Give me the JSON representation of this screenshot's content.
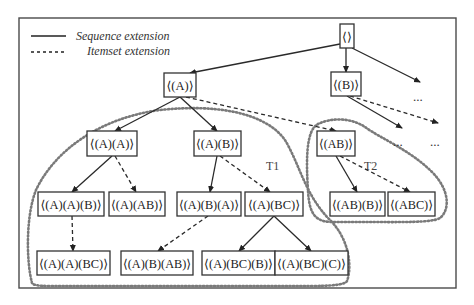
{
  "diagram": {
    "legend": {
      "sequence_label": "Sequence extension",
      "itemset_label": "Itemset extension"
    },
    "frame": {
      "x": 19,
      "y": 18,
      "w": 437,
      "h": 270
    },
    "nodes": [
      {
        "id": "root",
        "label": "⟨⟩",
        "x": 340,
        "y": 24,
        "w": 14,
        "h": 24
      },
      {
        "id": "A",
        "label": "⟨(A)⟩",
        "x": 164,
        "y": 73,
        "w": 32,
        "h": 24
      },
      {
        "id": "B",
        "label": "⟨(B)⟩",
        "x": 331,
        "y": 72,
        "w": 30,
        "h": 24
      },
      {
        "id": "AA",
        "label": "⟨(A)(A)⟩",
        "x": 87,
        "y": 131,
        "w": 50,
        "h": 25
      },
      {
        "id": "AB_seq",
        "label": "⟨(A)(B)⟩",
        "x": 194,
        "y": 131,
        "w": 47,
        "h": 25
      },
      {
        "id": "AB_item",
        "label": "⟨(AB)⟩",
        "x": 317,
        "y": 131,
        "w": 38,
        "h": 25
      },
      {
        "id": "AAB",
        "label": "⟨(A)(A)(B)⟩",
        "x": 38,
        "y": 192,
        "w": 66,
        "h": 24
      },
      {
        "id": "A_AB",
        "label": "⟨(A)(AB)⟩",
        "x": 109,
        "y": 192,
        "w": 56,
        "h": 24
      },
      {
        "id": "ABA",
        "label": "⟨(A)(B)(A)⟩",
        "x": 177,
        "y": 192,
        "w": 64,
        "h": 24
      },
      {
        "id": "A_BC",
        "label": "⟨(A)(BC)⟩",
        "x": 245,
        "y": 192,
        "w": 58,
        "h": 24
      },
      {
        "id": "AB_B",
        "label": "⟨(AB)(B)⟩",
        "x": 330,
        "y": 192,
        "w": 55,
        "h": 24
      },
      {
        "id": "ABC",
        "label": "⟨(ABC)⟩",
        "x": 388,
        "y": 192,
        "w": 47,
        "h": 24
      },
      {
        "id": "AA_BC",
        "label": "⟨(A)(A)(BC)⟩",
        "x": 37,
        "y": 251,
        "w": 73,
        "h": 24
      },
      {
        "id": "AB_AB",
        "label": "⟨(A)(B)(AB)⟩",
        "x": 121,
        "y": 251,
        "w": 72,
        "h": 24
      },
      {
        "id": "ABC_B",
        "label": "⟨(A)(BC)(B)⟩",
        "x": 202,
        "y": 251,
        "w": 73,
        "h": 24
      },
      {
        "id": "ABC_C",
        "label": "⟨(A)(BC)(C)⟩",
        "x": 275,
        "y": 251,
        "w": 73,
        "h": 24
      }
    ],
    "edges": [
      {
        "from": "root",
        "to": "A",
        "type": "sequence",
        "x1": 340,
        "y1": 44,
        "x2": 190,
        "y2": 73
      },
      {
        "from": "root",
        "to": "B",
        "type": "sequence",
        "x1": 346,
        "y1": 48,
        "x2": 346,
        "y2": 72
      },
      {
        "from": "root",
        "to": "more",
        "type": "sequence",
        "x1": 352,
        "y1": 48,
        "x2": 420,
        "y2": 82
      },
      {
        "from": "A",
        "to": "AA",
        "type": "sequence",
        "x1": 180,
        "y1": 97,
        "x2": 115,
        "y2": 131
      },
      {
        "from": "A",
        "to": "AB_seq",
        "type": "sequence",
        "x1": 180,
        "y1": 97,
        "x2": 217,
        "y2": 131
      },
      {
        "from": "A",
        "to": "AB_item",
        "type": "itemset",
        "x1": 186,
        "y1": 97,
        "x2": 336,
        "y2": 131
      },
      {
        "from": "B",
        "to": "more",
        "type": "sequence",
        "x1": 347,
        "y1": 96,
        "x2": 402,
        "y2": 128
      },
      {
        "from": "B",
        "to": "more",
        "type": "itemset",
        "x1": 350,
        "y1": 96,
        "x2": 438,
        "y2": 123
      },
      {
        "from": "AA",
        "to": "AAB",
        "type": "sequence",
        "x1": 112,
        "y1": 156,
        "x2": 72,
        "y2": 192
      },
      {
        "from": "AA",
        "to": "A_AB",
        "type": "itemset",
        "x1": 115,
        "y1": 156,
        "x2": 136,
        "y2": 192
      },
      {
        "from": "AB_seq",
        "to": "ABA",
        "type": "sequence",
        "x1": 217,
        "y1": 156,
        "x2": 210,
        "y2": 192
      },
      {
        "from": "AB_seq",
        "to": "A_BC",
        "type": "itemset",
        "x1": 220,
        "y1": 156,
        "x2": 270,
        "y2": 192
      },
      {
        "from": "AB_item",
        "to": "AB_B",
        "type": "sequence",
        "x1": 336,
        "y1": 156,
        "x2": 357,
        "y2": 192
      },
      {
        "from": "AB_item",
        "to": "ABC",
        "type": "itemset",
        "x1": 340,
        "y1": 156,
        "x2": 410,
        "y2": 192
      },
      {
        "from": "AAB",
        "to": "AA_BC",
        "type": "itemset",
        "x1": 72,
        "y1": 216,
        "x2": 73,
        "y2": 251
      },
      {
        "from": "ABA",
        "to": "AB_AB",
        "type": "itemset",
        "x1": 208,
        "y1": 216,
        "x2": 158,
        "y2": 251
      },
      {
        "from": "A_BC",
        "to": "ABC_B",
        "type": "sequence",
        "x1": 274,
        "y1": 216,
        "x2": 239,
        "y2": 251
      },
      {
        "from": "A_BC",
        "to": "ABC_C",
        "type": "sequence",
        "x1": 274,
        "y1": 216,
        "x2": 311,
        "y2": 251
      }
    ],
    "ellipses": [
      {
        "label": "...",
        "x": 413,
        "y": 101
      },
      {
        "label": "...",
        "x": 393,
        "y": 146
      },
      {
        "label": "...",
        "x": 430,
        "y": 146
      }
    ],
    "groups": [
      {
        "id": "T1",
        "label": "T1",
        "label_x": 266,
        "label_y": 170,
        "path": "M 32 283 C 26 260, 26 215, 36 190 C 55 150, 100 118, 160 110 C 215 104, 265 112, 285 140 C 300 165, 305 195, 330 220 C 350 240, 352 268, 347 281 C 345 285, 330 286, 310 286 L 50 286 C 38 286, 33 285, 32 283 Z"
      },
      {
        "id": "T2",
        "label": "T2",
        "label_x": 364,
        "label_y": 170,
        "path": "M 308 190 C 306 160, 306 130, 318 124 C 330 118, 350 117, 365 127 C 380 138, 410 150, 432 172 C 450 190, 450 210, 440 218 C 432 223, 400 222, 360 222 L 330 222 C 314 221, 309 212, 308 190 Z"
      }
    ]
  }
}
